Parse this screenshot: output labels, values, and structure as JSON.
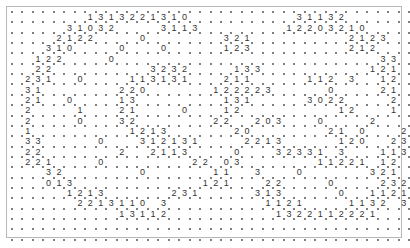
{
  "puzzle": {
    "type": "slitherlink",
    "cols": 38,
    "rows": 22,
    "grid": [
      ".......1313221310..........31132......",
      ".....31032....3113........12203210....",
      "....2122....0.......321.........2123..",
      "...310....0...0.....123.........212...",
      "..122....0.........................33.",
      "..22.........3232....133..........121.",
      ".231..0....113131...211.....112.3..12.",
      ".31.......220......122223.....0....21.",
      ".21..0....13........131.....3022....2.",
      ".2....1...21....0...12.........12...1.",
      ".2....0...32.......22..203...0....2...",
      ".1.........1213......20.......21.0...22",
      ".33.....0...312131....2213.....120..23",
      ".22.......2..2113....0...32331.3...113",
      ".221....0........22.03.......11221.12.",
      "...32.......0......11..3...0......321.",
      "...013............121...22....0....232",
      ".....1213......231.....313.....0..1121",
      "......2213110 3.........1121....1132 3",
      "..........13112..........1322112221...",
      "......................................",
      "......................................"
    ],
    "colors": {
      "dot": "#555555",
      "clue": "#333333",
      "border": "#b8b8b8",
      "background": "#ffffff"
    }
  }
}
